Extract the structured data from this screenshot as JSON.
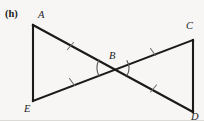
{
  "figure": {
    "part_label": "(h)",
    "canvas": {
      "width": 204,
      "height": 121
    },
    "background_color": "#f7f6f4",
    "stroke_color": "#1a1a1a",
    "label_color": "#242424",
    "vertices": [
      {
        "name": "A",
        "label": "A",
        "x": 33,
        "y": 25,
        "label_x": 38,
        "label_y": 11
      },
      {
        "name": "E",
        "label": "E",
        "x": 33,
        "y": 101,
        "label_x": 24,
        "label_y": 105
      },
      {
        "name": "C",
        "label": "C",
        "x": 193,
        "y": 40,
        "label_x": 186,
        "label_y": 22
      },
      {
        "name": "D",
        "label": "D",
        "x": 193,
        "y": 112,
        "label_x": 190,
        "label_y": 113
      },
      {
        "name": "B",
        "label": "B",
        "x": 113,
        "y": 68,
        "label_x": 109,
        "label_y": 52
      }
    ],
    "segments": [
      {
        "name": "AE",
        "from": "A",
        "to": "E",
        "ticks": 0
      },
      {
        "name": "CD",
        "from": "C",
        "to": "D",
        "ticks": 0
      },
      {
        "name": "AB",
        "from": "A",
        "to": "B",
        "ticks": 1
      },
      {
        "name": "BD",
        "from": "B",
        "to": "D",
        "ticks": 1
      },
      {
        "name": "EB",
        "from": "E",
        "to": "B",
        "ticks": 1
      },
      {
        "name": "BC",
        "from": "B",
        "to": "C",
        "ticks": 1
      }
    ],
    "angle_arcs": [
      {
        "name": "angle-ABE",
        "at": "B",
        "opens": "left",
        "radius": 15
      },
      {
        "name": "angle-CBD",
        "at": "B",
        "opens": "right",
        "radius": 15
      }
    ]
  }
}
